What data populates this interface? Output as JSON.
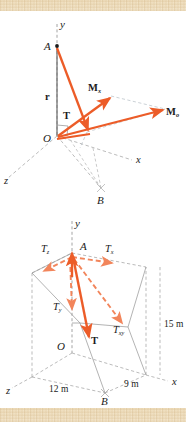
{
  "figure": {
    "type": "engineering-vector-diagram",
    "panels": [
      {
        "id": "top",
        "name": "moment-of-force-diagram",
        "description": "Moment of tension T about point O resolved into components",
        "axes": {
          "x": "x",
          "y": "y",
          "z": "z"
        },
        "points": [
          {
            "label": "A",
            "role": "cable-top-anchor"
          },
          {
            "label": "O",
            "role": "origin"
          },
          {
            "label": "B",
            "role": "cable-ground-anchor"
          }
        ],
        "vectors": [
          {
            "label": "r",
            "style": "bold",
            "role": "position-vector"
          },
          {
            "label": "T",
            "style": "bold",
            "role": "tension-force"
          },
          {
            "label": "M",
            "sub": "x",
            "style": "bold",
            "role": "moment-x-component"
          },
          {
            "label": "M",
            "sub": "o",
            "style": "bold",
            "role": "moment-about-o"
          }
        ]
      },
      {
        "id": "bottom",
        "name": "tension-components-diagram",
        "description": "Tension T at A resolved into rectangular components",
        "axes": {
          "x": "x",
          "y": "y",
          "z": "z"
        },
        "points": [
          {
            "label": "A",
            "role": "cable-top-anchor"
          },
          {
            "label": "O",
            "role": "origin"
          },
          {
            "label": "B",
            "role": "cable-ground-anchor"
          }
        ],
        "vectors": [
          {
            "label": "T",
            "sub": "z",
            "role": "tension-z-component"
          },
          {
            "label": "T",
            "sub": "x",
            "role": "tension-x-component"
          },
          {
            "label": "T",
            "sub": "y",
            "role": "tension-y-component"
          },
          {
            "label": "T",
            "sub": "xy",
            "role": "tension-xy-projection"
          },
          {
            "label": "T",
            "style": "bold",
            "role": "tension-force"
          }
        ],
        "dimensions": [
          {
            "label": "15 m",
            "role": "height-OA"
          },
          {
            "label": "12 m",
            "role": "depth-z"
          },
          {
            "label": "9 m",
            "role": "width-x"
          }
        ]
      }
    ],
    "colors": {
      "vector": "#ec5c28",
      "vector_light": "#f2855b",
      "construction": "#a9a9a9",
      "axis": "#8e8e8e",
      "text": "#1b1b1b",
      "background": "#ffffff",
      "paper": "#f3e4c6"
    }
  }
}
